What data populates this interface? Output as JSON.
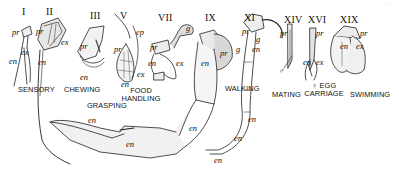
{
  "figure": {
    "corner_mark": "· · ·",
    "appendages": [
      {
        "numeral": "I",
        "function": "SENSORY",
        "parts": [
          "pr",
          "ex",
          "en"
        ]
      },
      {
        "numeral": "II",
        "function": "SENSORY",
        "parts": [
          "pr",
          "ex",
          "en"
        ]
      },
      {
        "numeral": "III",
        "function": "CHEWING",
        "parts": [
          "pr",
          "en"
        ]
      },
      {
        "numeral": "V",
        "function": "FOOD HANDLING",
        "parts": [
          "ep",
          "pr",
          "ex",
          "en"
        ]
      },
      {
        "numeral": "VII",
        "function": "FOOD HANDLING",
        "parts": [
          "pr",
          "g",
          "en",
          "ex"
        ]
      },
      {
        "numeral": "IX",
        "function": "GRASPING",
        "parts": [
          "pr",
          "g",
          "en",
          "en",
          "en"
        ]
      },
      {
        "numeral": "XI",
        "function": "WALKING",
        "parts": [
          "pr",
          "g",
          "en",
          "en",
          "en",
          "en"
        ]
      },
      {
        "numeral": "XIV",
        "function": "MATING",
        "parts": [
          "pr",
          "♂"
        ]
      },
      {
        "numeral": "XVI",
        "function": "♀ EGG CARRIAGE",
        "parts": [
          "pr",
          "en",
          "ex"
        ]
      },
      {
        "numeral": "XIX",
        "function": "SWIMMING",
        "parts": [
          "pr",
          "en",
          "ex"
        ]
      }
    ]
  },
  "numerals": {
    "I": "I",
    "II": "II",
    "III": "III",
    "V": "V",
    "VII": "VII",
    "IX": "IX",
    "XI": "XI",
    "XIV": "XIV",
    "XVI": "XVI",
    "XIX": "XIX"
  },
  "functions": {
    "sensory": "SENSORY",
    "chewing": "CHEWING",
    "grasping": "GRASPING",
    "food_handling_1": "FOOD",
    "food_handling_2": "HANDLING",
    "walking": "WALKING",
    "mating": "MATING",
    "egg_1": "♀ EGG",
    "egg_2": "CARRIAGE",
    "swimming": "SWIMMING"
  },
  "parts": {
    "pr": "pr",
    "ex": "ex",
    "en": "en",
    "ep": "ep",
    "g": "g",
    "male": "♂"
  }
}
